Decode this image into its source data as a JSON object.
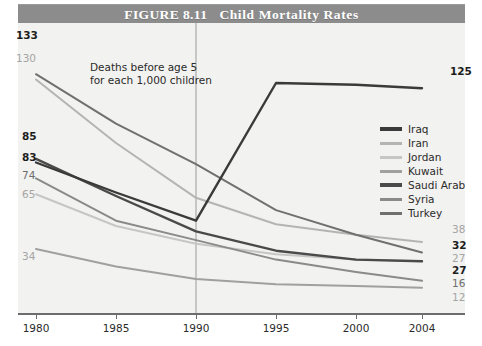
{
  "figure": {
    "label": "FIGURE 8.11",
    "title": "Child Mortality Rates"
  },
  "annotations": {
    "deaths_line1": "Deaths before age 5",
    "deaths_line2": "for each 1,000 children",
    "sanctions": "Sanctions on Iraq begin"
  },
  "legend": {
    "items": [
      {
        "label": "Iraq",
        "color": "#3a3a3a"
      },
      {
        "label": "Iran",
        "color": "#b4b4b4"
      },
      {
        "label": "Jordan",
        "color": "#c6c6c6"
      },
      {
        "label": "Kuwait",
        "color": "#a0a0a0"
      },
      {
        "label": "Saudi Arabia",
        "color": "#4a4a4a"
      },
      {
        "label": "Syria",
        "color": "#8a8a8a"
      },
      {
        "label": "Turkey",
        "color": "#707070"
      }
    ]
  },
  "left_labels": [
    {
      "text": "133",
      "weight": "bold"
    },
    {
      "text": "130",
      "weight": "light"
    },
    {
      "text": "85",
      "weight": "bold"
    },
    {
      "text": "83",
      "weight": "bold"
    },
    {
      "text": "74",
      "weight": "mid"
    },
    {
      "text": "65",
      "weight": "light"
    },
    {
      "text": "34",
      "weight": "light"
    }
  ],
  "right_labels": [
    {
      "text": "125",
      "weight": "bold"
    },
    {
      "text": "38",
      "weight": "light"
    },
    {
      "text": "32",
      "weight": "bold"
    },
    {
      "text": "27",
      "weight": "light"
    },
    {
      "text": "27",
      "weight": "bold"
    },
    {
      "text": "16",
      "weight": "mid"
    },
    {
      "text": "12",
      "weight": "light"
    }
  ],
  "chart_data": {
    "type": "line",
    "title": "Child Mortality Rates",
    "subtitle": "FIGURE 8.11",
    "xlabel": "",
    "ylabel": "Deaths before age 5 for each 1,000 children",
    "x": [
      1980,
      1985,
      1990,
      1995,
      2000,
      2004
    ],
    "xticklabels": [
      "1980",
      "1985",
      "1990",
      "1995",
      "2000",
      "2004"
    ],
    "ylim": [
      0,
      145
    ],
    "grid": false,
    "legend_position": "right-center",
    "vertical_marker": {
      "x": 1990,
      "label": "Sanctions on Iraq begin"
    },
    "series": [
      {
        "name": "Iraq",
        "color": "#3a3a3a",
        "values": [
          83,
          66,
          50,
          128,
          127,
          125
        ],
        "start_label": "83",
        "end_label": "125"
      },
      {
        "name": "Iran",
        "color": "#b4b4b4",
        "values": [
          130,
          94,
          63,
          48,
          42,
          38
        ],
        "start_label": "130",
        "end_label": "38"
      },
      {
        "name": "Jordan",
        "color": "#c6c6c6",
        "values": [
          65,
          47,
          37,
          31,
          28,
          27
        ],
        "start_label": "65",
        "end_label": "27"
      },
      {
        "name": "Kuwait",
        "color": "#a0a0a0",
        "values": [
          34,
          24,
          17,
          14,
          13,
          12
        ],
        "start_label": "34",
        "end_label": "12"
      },
      {
        "name": "Saudi Arabia",
        "color": "#4a4a4a",
        "values": [
          85,
          64,
          44,
          33,
          28,
          27
        ],
        "start_label": "85",
        "end_label": "27"
      },
      {
        "name": "Syria",
        "color": "#8a8a8a",
        "values": [
          74,
          50,
          39,
          28,
          21,
          16
        ],
        "start_label": "74",
        "end_label": "16"
      },
      {
        "name": "Turkey",
        "color": "#707070",
        "values": [
          133,
          105,
          82,
          56,
          42,
          32
        ],
        "start_label": "133",
        "end_label": "32"
      }
    ]
  }
}
